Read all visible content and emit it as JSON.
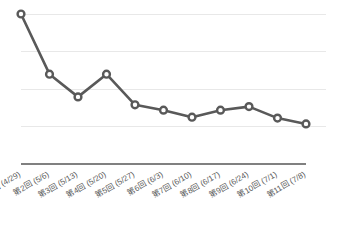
{
  "chart_data": {
    "type": "line",
    "title": "",
    "subtitle": "",
    "xlabel": "",
    "ylabel": "",
    "grid": true,
    "grid_axis": "y",
    "legend": false,
    "legend_position": "none",
    "ylim": [
      25,
      100
    ],
    "y_gridline_values": [
      100,
      75,
      50,
      25
    ],
    "y_tick_labels": [],
    "x_tick_rotation_deg": -30,
    "categories": [
      "第1回 (4/29)",
      "第2回 (5/6)",
      "第3回 (5/13)",
      "第4回 (5/20)",
      "第5回 (5/27)",
      "第6回 (6/3)",
      "第7回 (6/10)",
      "第8回 (6/17)",
      "第9回 (6/24)",
      "第10回 (7/1)",
      "第11回 (7/8)"
    ],
    "series": [
      {
        "name": "",
        "color": "#595959",
        "marker": "open-circle",
        "marker_fill": "#ffffff",
        "values": [
          100,
          59.7,
          44.5,
          59.7,
          39.2,
          35.6,
          30.9,
          35.6,
          38.0,
          30.3,
          26.4
        ]
      }
    ],
    "annotations": []
  },
  "style": {
    "background": "#ffffff",
    "line_color": "#595959",
    "marker_fill": "#ffffff",
    "grid_color": "#e8e8e8",
    "axis_color": "#808080",
    "label_color": "#5a5a5a"
  },
  "layout": {
    "plot_left": 21,
    "plot_right": 306,
    "plot_top": 14,
    "plot_bottom": 126,
    "axis_y": 164,
    "label_baseline_y": 176
  }
}
